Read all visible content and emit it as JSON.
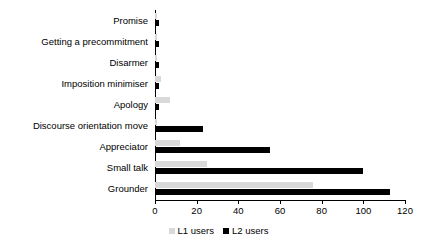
{
  "chart_data": {
    "type": "bar",
    "orientation": "horizontal",
    "title": "",
    "xlabel": "",
    "ylabel": "",
    "xlim": [
      0,
      120
    ],
    "xticks": [
      0,
      20,
      40,
      60,
      80,
      100,
      120
    ],
    "grid": false,
    "legend_position": "bottom-center",
    "categories": [
      "Promise",
      "Getting a precommitment",
      "Disarmer",
      "Imposition minimiser",
      "Apology",
      "Discourse orientation move",
      "Appreciator",
      "Small talk",
      "Grounder"
    ],
    "series": [
      {
        "name": "L1 users",
        "color": "#d9d9d9",
        "values": [
          1,
          1,
          1,
          3,
          7,
          1,
          12,
          25,
          76
        ]
      },
      {
        "name": "L2 users",
        "color": "#000000",
        "values": [
          2,
          2,
          2,
          2,
          2,
          23,
          55,
          100,
          113
        ]
      }
    ]
  },
  "legend": {
    "items": [
      {
        "label": "L1 users",
        "color": "#d9d9d9"
      },
      {
        "label": "L2 users",
        "color": "#000000"
      }
    ]
  }
}
